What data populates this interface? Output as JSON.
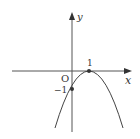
{
  "diagram": {
    "type": "function-graph",
    "axes": {
      "x_label": "x",
      "y_label": "y",
      "origin_label": "O"
    },
    "curve": {
      "kind": "parabola-opening-downward",
      "vertex": [
        1,
        0
      ],
      "y_intercept": [
        0,
        -1
      ],
      "equation": "y = -(x-1)^2"
    },
    "tick_labels": {
      "x_one": "1",
      "y_neg_one": "−1"
    },
    "colors": {
      "line": "#333333",
      "background": "#ffffff"
    }
  }
}
